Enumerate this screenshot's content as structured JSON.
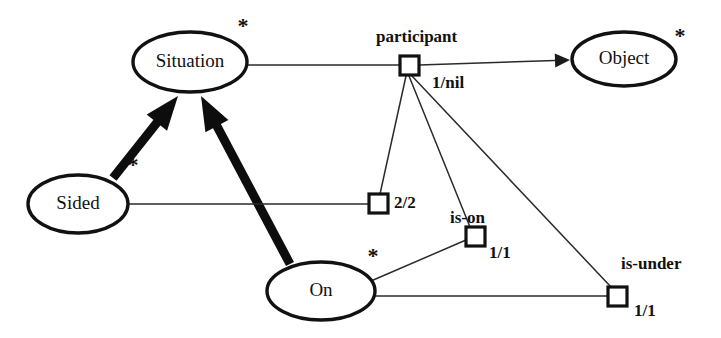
{
  "diagram": {
    "background_color": "#ffffff",
    "line_color": "#111111",
    "entities": [
      {
        "id": "situation",
        "label": "Situation",
        "cx": 190,
        "cy": 62,
        "rx": 57,
        "ry": 30
      },
      {
        "id": "object",
        "label": "Object",
        "cx": 624,
        "cy": 59,
        "rx": 52,
        "ry": 27
      },
      {
        "id": "sided",
        "label": "Sided",
        "cx": 78,
        "cy": 204,
        "rx": 50,
        "ry": 29
      },
      {
        "id": "on",
        "label": "On",
        "cx": 321,
        "cy": 291,
        "rx": 54,
        "ry": 29
      }
    ],
    "relation_nodes": [
      {
        "id": "participant",
        "label": "participant",
        "label_x": 376,
        "label_y": 38,
        "mult": "1/nil",
        "mult_x": 432,
        "mult_y": 84,
        "x": 400,
        "y": 56,
        "size": 19
      },
      {
        "id": "node-2-2",
        "label": "",
        "label_x": 0,
        "label_y": 0,
        "mult": "2/2",
        "mult_x": 394,
        "mult_y": 204,
        "x": 369,
        "y": 194,
        "size": 19
      },
      {
        "id": "is-on",
        "label": "is-on",
        "label_x": 450,
        "label_y": 219,
        "mult": "1/1",
        "mult_x": 489,
        "mult_y": 254,
        "x": 466,
        "y": 227,
        "size": 19
      },
      {
        "id": "is-under",
        "label": "is-under",
        "label_x": 621,
        "label_y": 265,
        "mult": "1/1",
        "mult_x": 634,
        "mult_y": 312,
        "x": 608,
        "y": 287,
        "size": 19
      }
    ],
    "multiplicity_stars": [
      {
        "id": "star-situation",
        "symbol": "*",
        "x": 243,
        "y": 28
      },
      {
        "id": "star-object",
        "symbol": "*",
        "x": 680,
        "y": 38
      },
      {
        "id": "star-sided",
        "symbol": "*",
        "x": 133,
        "y": 167
      },
      {
        "id": "star-on",
        "symbol": "*",
        "x": 373,
        "y": 258
      }
    ],
    "edges": [
      {
        "id": "sided-to-situation",
        "kind": "generalization-thick",
        "from": "sided",
        "to": "situation",
        "x1": 113,
        "y1": 178,
        "x2": 178,
        "y2": 96
      },
      {
        "id": "on-to-situation",
        "kind": "generalization-thick",
        "from": "on",
        "to": "situation",
        "x1": 290,
        "y1": 264,
        "x2": 201,
        "y2": 96
      },
      {
        "id": "situation-to-participant",
        "kind": "association-thin",
        "from": "situation",
        "to": "participant",
        "x1": 247,
        "y1": 65,
        "x2": 400,
        "y2": 65
      },
      {
        "id": "participant-to-object",
        "kind": "association-arrow",
        "from": "participant",
        "to": "object",
        "x1": 419,
        "y1": 65,
        "x2": 570,
        "y2": 60
      },
      {
        "id": "participant-to-2-2",
        "kind": "association-thin",
        "from": "participant",
        "to": "node-2-2",
        "x1": 406,
        "y1": 76,
        "x2": 380,
        "y2": 194
      },
      {
        "id": "participant-to-is-on",
        "kind": "association-thin",
        "from": "participant",
        "to": "is-on",
        "x1": 409,
        "y1": 76,
        "x2": 470,
        "y2": 227
      },
      {
        "id": "participant-to-is-under",
        "kind": "association-thin",
        "from": "participant",
        "to": "is-under",
        "x1": 412,
        "y1": 76,
        "x2": 611,
        "y2": 287
      },
      {
        "id": "sided-to-2-2",
        "kind": "association-thin",
        "from": "sided",
        "to": "node-2-2",
        "x1": 128,
        "y1": 204,
        "x2": 369,
        "y2": 204
      },
      {
        "id": "on-to-is-on",
        "kind": "association-thin",
        "from": "on",
        "to": "is-on",
        "x1": 371,
        "y1": 281,
        "x2": 466,
        "y2": 240
      },
      {
        "id": "on-to-is-under",
        "kind": "association-thin",
        "from": "on",
        "to": "is-under",
        "x1": 375,
        "y1": 296,
        "x2": 608,
        "y2": 296
      }
    ]
  }
}
